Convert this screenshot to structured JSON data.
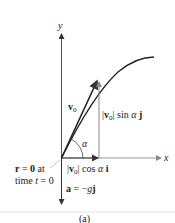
{
  "diagram": {
    "axes": {
      "x_label": "x",
      "y_label": "y"
    },
    "velocity": {
      "label_main": "v",
      "label_sub": "0"
    },
    "angle_label": "α",
    "vertical_component": {
      "bar1": "|",
      "v": "v",
      "sub": "0",
      "bar2": "|",
      "rest": " sin ",
      "alpha": "α",
      "unit": " j"
    },
    "horizontal_component": {
      "bar1": "|",
      "v": "v",
      "sub": "0",
      "bar2": "|",
      "rest": " cos ",
      "alpha": "α",
      "unit": " i"
    },
    "origin_note": {
      "r": "r",
      "eq": " = ",
      "zero": "0",
      "at": " at",
      "line2_time": "time ",
      "line2_t": "t",
      "line2_eq": " = 0"
    },
    "acceleration": {
      "a": "a",
      "eq": " = −",
      "g": "g",
      "j": "j"
    },
    "caption": "(a)",
    "colors": {
      "axis": "#555555",
      "curve": "#222222",
      "vector": "#222222",
      "component": "#777777",
      "divider": "#dddddd"
    }
  }
}
